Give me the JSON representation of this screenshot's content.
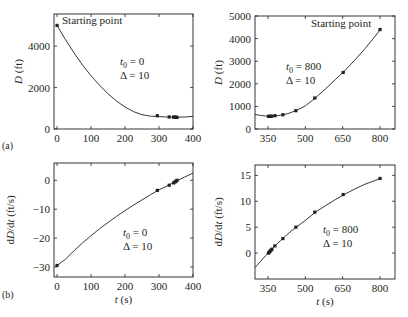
{
  "figure": {
    "panel_labels": [
      "(a)",
      "(b)"
    ]
  },
  "chart_data": [
    {
      "id": "a-left",
      "type": "line",
      "row": "a",
      "xlabel": "",
      "ylabel": "D (ft)",
      "ylabel_italic_part": "D",
      "ylabel_unit": " (ft)",
      "xlim": [
        -9,
        400
      ],
      "ylim": [
        0,
        5550
      ],
      "xticks": [
        0,
        100,
        200,
        300,
        400
      ],
      "yticks": [
        0,
        2000,
        4000
      ],
      "annotation_t0": "t₀ = 0",
      "annotation_t0_sub": "0",
      "annotation_t0_val": " = 0",
      "annotation_delta": "Δ = 10",
      "start_label": "Starting point",
      "curve": {
        "x": [
          0,
          25,
          50,
          75,
          100,
          125,
          150,
          175,
          200,
          225,
          250,
          275,
          300,
          325,
          350,
          375,
          400
        ],
        "y": [
          5000,
          4300,
          3670,
          3090,
          2570,
          2110,
          1700,
          1350,
          1060,
          840,
          690,
          620,
          600,
          580,
          570,
          580,
          610
        ]
      },
      "points": {
        "x": [
          0,
          295,
          330,
          343,
          347,
          350,
          353
        ],
        "y": [
          5000,
          640,
          580,
          575,
          570,
          565,
          560
        ]
      }
    },
    {
      "id": "a-right",
      "type": "line",
      "row": "a",
      "xlabel": "",
      "ylabel": "D (ft)",
      "ylabel_italic_part": "D",
      "ylabel_unit": " (ft)",
      "xlim": [
        298,
        860
      ],
      "ylim": [
        0,
        5000
      ],
      "xticks": [
        350,
        500,
        650,
        800
      ],
      "yticks": [
        0,
        1000,
        2000,
        3000,
        4000,
        5000
      ],
      "annotation_t0": "t₀ = 800",
      "annotation_t0_sub": "0",
      "annotation_t0_val": " = 800",
      "annotation_delta": "Δ = 10",
      "start_label": "Starting point",
      "curve": {
        "x": [
          298,
          320,
          340,
          355,
          370,
          400,
          430,
          460,
          500,
          540,
          580,
          620,
          660,
          700,
          740,
          780,
          800
        ],
        "y": [
          640,
          600,
          575,
          565,
          570,
          600,
          680,
          800,
          1020,
          1370,
          1760,
          2180,
          2600,
          3060,
          3560,
          4100,
          4400
        ]
      },
      "points": {
        "x": [
          352,
          356,
          360,
          365,
          378,
          410,
          462,
          538,
          652,
          800
        ],
        "y": [
          560,
          560,
          560,
          565,
          590,
          630,
          810,
          1370,
          2500,
          4400
        ]
      }
    },
    {
      "id": "b-left",
      "type": "line",
      "row": "b",
      "xlabel": "t (s)",
      "xlabel_italic_part": "t",
      "xlabel_unit": " (s)",
      "ylabel": "dD/dt (ft/s)",
      "ylabel_italic_part": "dD/dt",
      "ylabel_unit": " (ft/s)",
      "xlim": [
        -9,
        400
      ],
      "ylim": [
        -33.5,
        6
      ],
      "xticks": [
        0,
        100,
        200,
        300,
        400
      ],
      "yticks": [
        -30,
        -20,
        -10,
        0
      ],
      "annotation_t0": "t₀ = 0",
      "annotation_t0_sub": "0",
      "annotation_t0_val": " = 0",
      "annotation_delta": "Δ = 10",
      "curve": {
        "x": [
          0,
          25,
          50,
          75,
          100,
          125,
          150,
          175,
          200,
          225,
          250,
          275,
          300,
          325,
          350,
          375,
          400
        ],
        "y": [
          -29.5,
          -27.3,
          -24.4,
          -21.7,
          -19.2,
          -16.8,
          -14.6,
          -12.5,
          -10.5,
          -8.6,
          -6.8,
          -5.0,
          -3.3,
          -1.9,
          -0.3,
          1.1,
          2.5
        ]
      },
      "points": {
        "x": [
          0,
          295,
          330,
          343,
          347,
          350,
          353
        ],
        "y": [
          -29.5,
          -3.5,
          -1.7,
          -0.9,
          -0.6,
          -0.3,
          0.0
        ]
      }
    },
    {
      "id": "b-right",
      "type": "line",
      "row": "b",
      "xlabel": "t (s)",
      "xlabel_italic_part": "t",
      "xlabel_unit": " (s)",
      "ylabel": "dD/dt (ft/s)",
      "ylabel_italic_part": "dD/dt",
      "ylabel_unit": " (ft/s)",
      "xlim": [
        298,
        860
      ],
      "ylim": [
        -5,
        17
      ],
      "xticks": [
        350,
        500,
        650,
        800
      ],
      "yticks": [
        0,
        5,
        10,
        15
      ],
      "annotation_t0": "t₀ = 800",
      "annotation_t0_sub": "0",
      "annotation_t0_val": " = 800",
      "annotation_delta": "Δ = 10",
      "curve": {
        "x": [
          298,
          320,
          340,
          355,
          370,
          400,
          430,
          460,
          500,
          540,
          580,
          620,
          660,
          700,
          740,
          780,
          800
        ],
        "y": [
          -2.8,
          -1.6,
          -0.5,
          0.2,
          1.0,
          2.4,
          3.7,
          4.9,
          6.3,
          7.9,
          9.1,
          10.3,
          11.4,
          12.4,
          13.3,
          14.0,
          14.4
        ]
      },
      "points": {
        "x": [
          352,
          355,
          358,
          362,
          366,
          378,
          410,
          462,
          538,
          652,
          800
        ],
        "y": [
          0.0,
          0.15,
          0.35,
          0.55,
          0.75,
          1.4,
          2.8,
          5.0,
          7.9,
          11.3,
          14.4
        ]
      }
    }
  ]
}
